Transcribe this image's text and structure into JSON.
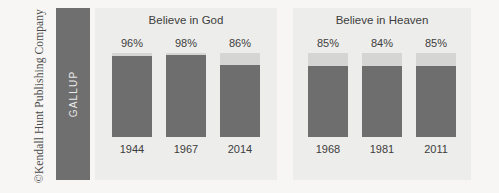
{
  "copyright": {
    "text": "©Kendall Hunt Publishing Company"
  },
  "brand": {
    "label": "GALLUP"
  },
  "colors": {
    "bar_fill": "#6e6e6e",
    "bar_track": "#d5d5d3",
    "panel_background": "#ededeb",
    "page_background": "#f7f6f4",
    "brand_block": "#6f6f6f",
    "text": "#3d3d3d"
  },
  "chart_data": [
    {
      "type": "bar",
      "title": "Believe in God",
      "xlabel": "",
      "ylabel": "",
      "ylim": [
        0,
        100
      ],
      "grid": false,
      "legend": "none",
      "categories": [
        "1944",
        "1967",
        "2014"
      ],
      "values": [
        96,
        98,
        86
      ],
      "value_labels": [
        "96%",
        "98%",
        "86%"
      ]
    },
    {
      "type": "bar",
      "title": "Believe in Heaven",
      "xlabel": "",
      "ylabel": "",
      "ylim": [
        0,
        100
      ],
      "grid": false,
      "legend": "none",
      "categories": [
        "1968",
        "1981",
        "2011"
      ],
      "values": [
        85,
        84,
        85
      ],
      "value_labels": [
        "85%",
        "84%",
        "85%"
      ]
    }
  ]
}
